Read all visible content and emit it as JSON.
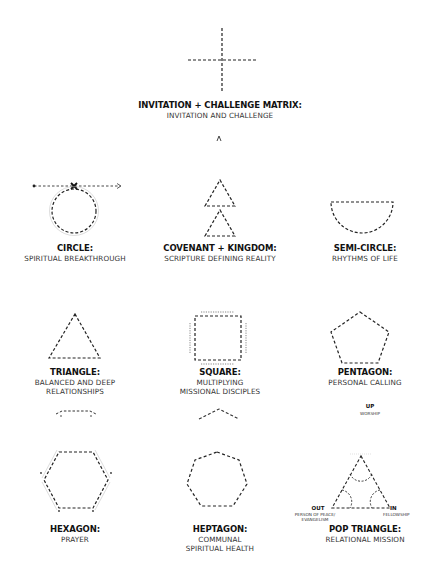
{
  "diagram": {
    "items": [
      {
        "id": "matrix",
        "title": "INVITATION + CHALLENGE MATRIX:",
        "subtitle": "INVITATION AND CHALLENGE"
      },
      {
        "id": "circle",
        "title": "CIRCLE:",
        "subtitle": "SPIRITUAL BREAKTHROUGH"
      },
      {
        "id": "covenant",
        "title": "COVENANT + KINGDOM:",
        "subtitle": "SCRIPTURE DEFINING REALITY"
      },
      {
        "id": "semicircle",
        "title": "SEMI-CIRCLE:",
        "subtitle": "RHYTHMS OF LIFE"
      },
      {
        "id": "triangle",
        "title": "TRIANGLE:",
        "subtitle_lines": [
          "BALANCED AND DEEP",
          "RELATIONSHIPS"
        ]
      },
      {
        "id": "square",
        "title": "SQUARE:",
        "subtitle_lines": [
          "MULTIPLYING",
          "MISSIONAL DISCIPLES"
        ]
      },
      {
        "id": "pentagon",
        "title": "PENTAGON:",
        "subtitle": "PERSONAL CALLING"
      },
      {
        "id": "hexagon",
        "title": "HEXAGON:",
        "subtitle": "PRAYER"
      },
      {
        "id": "heptagon",
        "title": "HEPTAGON:",
        "subtitle_lines": [
          "COMMUNAL",
          "SPIRITUAL HEALTH"
        ]
      },
      {
        "id": "pop",
        "title": "POP TRIANGLE:",
        "subtitle": "RELATIONAL MISSION",
        "up": {
          "label": "UP",
          "sub": "WORSHIP"
        },
        "out": {
          "label": "OUT",
          "sub_lines": [
            "PERSON OF PEACE/",
            "EVANGELISM"
          ]
        },
        "in": {
          "label": "IN",
          "sub": "FELLOWSHIP"
        }
      }
    ],
    "stroke_color": "#222222"
  }
}
